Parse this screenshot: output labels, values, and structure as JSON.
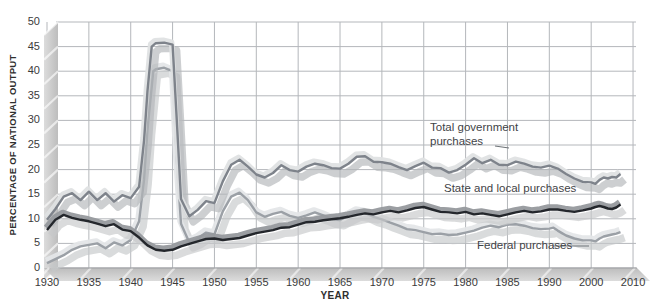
{
  "figure": {
    "y_axis_title": "PERCENTAGE OF NATIONAL OUTPUT",
    "x_axis_title": "YEAR"
  },
  "chart_data": {
    "type": "line",
    "title": "",
    "xlabel": "YEAR",
    "ylabel": "PERCENTAGE OF NATIONAL OUTPUT",
    "ylim": [
      0,
      50
    ],
    "xlim_years": [
      1930,
      2010
    ],
    "grid": true,
    "legend_position": "inline-annotations",
    "note_axis": "x axis compressed after 1990: ticks 1990, 2000, 2010 are equally spaced with the 5-year ticks",
    "y_ticks": [
      {
        "value": 0,
        "label": "0"
      },
      {
        "value": 5,
        "label": "5"
      },
      {
        "value": 10,
        "label": "10"
      },
      {
        "value": 15,
        "label": "15"
      },
      {
        "value": 20,
        "label": "20"
      },
      {
        "value": 25,
        "label": "25"
      },
      {
        "value": 30,
        "label": "30"
      },
      {
        "value": 35,
        "label": "35"
      },
      {
        "value": 40,
        "label": "40"
      },
      {
        "value": 45,
        "label": "45"
      },
      {
        "value": 50,
        "label": "50"
      }
    ],
    "x_ticks": [
      {
        "year": 1930,
        "label": "1930"
      },
      {
        "year": 1935,
        "label": "1935"
      },
      {
        "year": 1940,
        "label": "1940"
      },
      {
        "year": 1945,
        "label": "1945"
      },
      {
        "year": 1950,
        "label": "1950"
      },
      {
        "year": 1955,
        "label": "1955"
      },
      {
        "year": 1960,
        "label": "1960"
      },
      {
        "year": 1965,
        "label": "1965"
      },
      {
        "year": 1970,
        "label": "1970"
      },
      {
        "year": 1975,
        "label": "1975"
      },
      {
        "year": 1980,
        "label": "1980"
      },
      {
        "year": 1985,
        "label": "1985"
      },
      {
        "year": 1990,
        "label": "1990"
      },
      {
        "year": 2000,
        "label": "2000"
      },
      {
        "year": 2010,
        "label": "2010"
      }
    ],
    "series": [
      {
        "name": "Total government purchases",
        "color": "#7e838b",
        "highlight": "#dfe1e3",
        "shadow": "#b2b5b8",
        "points": [
          [
            1930,
            9.8
          ],
          [
            1931,
            12.0
          ],
          [
            1932,
            14.5
          ],
          [
            1933,
            15.2
          ],
          [
            1934,
            13.8
          ],
          [
            1935,
            15.5
          ],
          [
            1936,
            13.8
          ],
          [
            1937,
            15.2
          ],
          [
            1938,
            13.5
          ],
          [
            1939,
            14.8
          ],
          [
            1940,
            14.2
          ],
          [
            1941,
            16.5
          ],
          [
            1941.6,
            26
          ],
          [
            1942,
            36
          ],
          [
            1942.5,
            45
          ],
          [
            1943,
            45.7
          ],
          [
            1944,
            45.8
          ],
          [
            1945,
            45.4
          ],
          [
            1945.5,
            30
          ],
          [
            1946,
            14
          ],
          [
            1947,
            10.5
          ],
          [
            1948,
            11.8
          ],
          [
            1949,
            13.6
          ],
          [
            1950,
            13.2
          ],
          [
            1951,
            17.6
          ],
          [
            1952,
            21.0
          ],
          [
            1953,
            22.0
          ],
          [
            1954,
            20.6
          ],
          [
            1955,
            19.0
          ],
          [
            1956,
            18.4
          ],
          [
            1957,
            19.3
          ],
          [
            1958,
            20.9
          ],
          [
            1959,
            19.9
          ],
          [
            1960,
            19.6
          ],
          [
            1961,
            20.6
          ],
          [
            1962,
            21.2
          ],
          [
            1963,
            20.9
          ],
          [
            1964,
            20.3
          ],
          [
            1965,
            20.2
          ],
          [
            1966,
            21.2
          ],
          [
            1967,
            22.6
          ],
          [
            1968,
            22.7
          ],
          [
            1969,
            21.6
          ],
          [
            1970,
            21.5
          ],
          [
            1971,
            21.2
          ],
          [
            1972,
            20.5
          ],
          [
            1973,
            19.9
          ],
          [
            1974,
            20.7
          ],
          [
            1975,
            21.4
          ],
          [
            1976,
            20.4
          ],
          [
            1977,
            20.3
          ],
          [
            1978,
            19.4
          ],
          [
            1979,
            19.9
          ],
          [
            1980,
            21.0
          ],
          [
            1981,
            22.3
          ],
          [
            1982,
            21.3
          ],
          [
            1983,
            22.0
          ],
          [
            1984,
            21.0
          ],
          [
            1985,
            20.9
          ],
          [
            1986,
            21.6
          ],
          [
            1987,
            21.2
          ],
          [
            1988,
            20.6
          ],
          [
            1989,
            20.4
          ],
          [
            1990,
            20.8
          ],
          [
            1992,
            20.2
          ],
          [
            1994,
            19.1
          ],
          [
            1996,
            18.2
          ],
          [
            1998,
            17.5
          ],
          [
            2000,
            17.4
          ],
          [
            2001,
            17.1
          ],
          [
            2002,
            17.9
          ],
          [
            2003,
            18.4
          ],
          [
            2004,
            18.2
          ],
          [
            2005,
            18.5
          ],
          [
            2006,
            18.4
          ],
          [
            2007,
            19.1
          ]
        ]
      },
      {
        "name": "State and local purchases",
        "color": "#24272c",
        "highlight": "#96999d",
        "shadow": "#c6c8ca",
        "points": [
          [
            1930,
            7.7
          ],
          [
            1931,
            9.8
          ],
          [
            1932,
            10.8
          ],
          [
            1933,
            10.2
          ],
          [
            1934,
            9.8
          ],
          [
            1935,
            9.5
          ],
          [
            1936,
            9.0
          ],
          [
            1937,
            8.5
          ],
          [
            1938,
            8.9
          ],
          [
            1939,
            7.8
          ],
          [
            1940,
            7.5
          ],
          [
            1941,
            6.2
          ],
          [
            1942,
            4.6
          ],
          [
            1943,
            3.7
          ],
          [
            1944,
            3.5
          ],
          [
            1945,
            3.7
          ],
          [
            1946,
            4.4
          ],
          [
            1947,
            4.9
          ],
          [
            1948,
            5.4
          ],
          [
            1949,
            5.9
          ],
          [
            1950,
            6.0
          ],
          [
            1951,
            5.7
          ],
          [
            1952,
            5.9
          ],
          [
            1953,
            6.1
          ],
          [
            1954,
            6.6
          ],
          [
            1955,
            7.1
          ],
          [
            1956,
            7.4
          ],
          [
            1957,
            7.7
          ],
          [
            1958,
            8.2
          ],
          [
            1959,
            8.3
          ],
          [
            1960,
            8.8
          ],
          [
            1961,
            9.3
          ],
          [
            1962,
            9.4
          ],
          [
            1963,
            9.7
          ],
          [
            1964,
            9.9
          ],
          [
            1965,
            10.1
          ],
          [
            1966,
            10.4
          ],
          [
            1967,
            10.8
          ],
          [
            1968,
            11.1
          ],
          [
            1969,
            10.9
          ],
          [
            1970,
            11.3
          ],
          [
            1971,
            11.6
          ],
          [
            1972,
            11.3
          ],
          [
            1973,
            11.7
          ],
          [
            1974,
            12.2
          ],
          [
            1975,
            12.4
          ],
          [
            1976,
            11.9
          ],
          [
            1977,
            11.4
          ],
          [
            1978,
            11.3
          ],
          [
            1979,
            11.1
          ],
          [
            1980,
            11.4
          ],
          [
            1981,
            10.9
          ],
          [
            1982,
            11.1
          ],
          [
            1983,
            10.8
          ],
          [
            1984,
            10.5
          ],
          [
            1985,
            10.9
          ],
          [
            1986,
            11.3
          ],
          [
            1987,
            11.6
          ],
          [
            1988,
            11.3
          ],
          [
            1989,
            11.5
          ],
          [
            1990,
            11.9
          ],
          [
            1992,
            11.9
          ],
          [
            1994,
            11.6
          ],
          [
            1996,
            11.4
          ],
          [
            1998,
            11.7
          ],
          [
            2000,
            12.1
          ],
          [
            2001,
            12.4
          ],
          [
            2002,
            12.6
          ],
          [
            2003,
            12.4
          ],
          [
            2004,
            12.1
          ],
          [
            2005,
            12.0
          ],
          [
            2006,
            12.3
          ],
          [
            2007,
            12.9
          ]
        ]
      },
      {
        "name": "Federal purchases",
        "color": "#9ba0a6",
        "highlight": "#e4e6e8",
        "shadow": "#c4c7ca",
        "points": [
          [
            1930,
            1.0
          ],
          [
            1931,
            1.8
          ],
          [
            1932,
            2.6
          ],
          [
            1933,
            3.7
          ],
          [
            1934,
            4.4
          ],
          [
            1935,
            4.7
          ],
          [
            1936,
            5.0
          ],
          [
            1937,
            4.0
          ],
          [
            1938,
            5.2
          ],
          [
            1939,
            4.6
          ],
          [
            1940,
            5.7
          ],
          [
            1941,
            9.5
          ],
          [
            1941.6,
            18
          ],
          [
            1942,
            28
          ],
          [
            1942.7,
            40
          ],
          [
            1943,
            40.4
          ],
          [
            1944,
            40.7
          ],
          [
            1945,
            40.0
          ],
          [
            1945.5,
            22
          ],
          [
            1946,
            9.0
          ],
          [
            1947,
            5.2
          ],
          [
            1948,
            6.0
          ],
          [
            1949,
            7.2
          ],
          [
            1950,
            6.8
          ],
          [
            1951,
            11.5
          ],
          [
            1952,
            14.5
          ],
          [
            1953,
            15.3
          ],
          [
            1954,
            13.8
          ],
          [
            1955,
            11.3
          ],
          [
            1956,
            10.4
          ],
          [
            1957,
            11.0
          ],
          [
            1958,
            11.4
          ],
          [
            1959,
            10.6
          ],
          [
            1960,
            10.2
          ],
          [
            1961,
            10.7
          ],
          [
            1962,
            11.3
          ],
          [
            1963,
            10.7
          ],
          [
            1964,
            10.0
          ],
          [
            1965,
            9.7
          ],
          [
            1966,
            10.6
          ],
          [
            1967,
            11.5
          ],
          [
            1968,
            11.2
          ],
          [
            1969,
            10.4
          ],
          [
            1970,
            9.9
          ],
          [
            1971,
            9.2
          ],
          [
            1972,
            8.6
          ],
          [
            1973,
            7.9
          ],
          [
            1974,
            7.7
          ],
          [
            1975,
            7.3
          ],
          [
            1976,
            6.9
          ],
          [
            1977,
            7.0
          ],
          [
            1978,
            6.7
          ],
          [
            1979,
            6.8
          ],
          [
            1980,
            7.2
          ],
          [
            1981,
            7.6
          ],
          [
            1982,
            8.2
          ],
          [
            1983,
            8.6
          ],
          [
            1984,
            8.3
          ],
          [
            1985,
            8.8
          ],
          [
            1986,
            8.9
          ],
          [
            1987,
            8.6
          ],
          [
            1988,
            8.1
          ],
          [
            1989,
            7.9
          ],
          [
            1990,
            8.0
          ],
          [
            1991,
            8.2
          ],
          [
            1992,
            7.6
          ],
          [
            1993,
            7.1
          ],
          [
            1994,
            6.6
          ],
          [
            1996,
            6.0
          ],
          [
            1998,
            5.6
          ],
          [
            2000,
            5.6
          ],
          [
            2001,
            5.4
          ],
          [
            2002,
            6.0
          ],
          [
            2003,
            6.4
          ],
          [
            2004,
            6.6
          ],
          [
            2005,
            6.8
          ],
          [
            2006,
            7.0
          ],
          [
            2007,
            7.3
          ]
        ]
      }
    ],
    "annotations": [
      {
        "text": "Total government purchases",
        "series_index": 0
      },
      {
        "text": "State and local purchases",
        "series_index": 1
      },
      {
        "text": "Federal purchases",
        "series_index": 2
      }
    ],
    "style": {
      "grid_color": "#b4b7bb",
      "zero_line_color": "#9b9ea1",
      "band_fill_light": "#dcdcdc",
      "band_fill_dark": "#bdbdbd",
      "hatch_color": "#ffffff",
      "leader_line_color": "#6f7478",
      "tick_text_color": "#3b3b3b",
      "label_text_color": "#3f4347"
    }
  }
}
